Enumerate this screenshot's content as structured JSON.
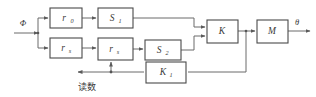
{
  "diagram": {
    "colors": {
      "background": "#ffffff",
      "box_stroke": "#4a4a4a",
      "wire": "#6b6b6b",
      "text": "#3a3a3a"
    },
    "blocks": [
      {
        "id": "r0",
        "label": "r",
        "subscript": "0",
        "x": 50,
        "y": 8,
        "w": 32,
        "h": 20
      },
      {
        "id": "s1",
        "label": "S",
        "subscript": "1",
        "x": 98,
        "y": 8,
        "w": 35,
        "h": 20
      },
      {
        "id": "rs",
        "label": "r",
        "subscript": "s",
        "x": 50,
        "y": 38,
        "w": 32,
        "h": 20
      },
      {
        "id": "rs2",
        "label": "r",
        "subscript": "s",
        "x": 98,
        "y": 38,
        "w": 35,
        "h": 22
      },
      {
        "id": "s2",
        "label": "S",
        "subscript": "2",
        "x": 145,
        "y": 40,
        "w": 36,
        "h": 20
      },
      {
        "id": "k",
        "label": "K",
        "subscript": "",
        "x": 207,
        "y": 20,
        "w": 31,
        "h": 23
      },
      {
        "id": "m",
        "label": "M",
        "subscript": "",
        "x": 257,
        "y": 20,
        "w": 31,
        "h": 23
      },
      {
        "id": "k1",
        "label": "K",
        "subscript": "1",
        "x": 146,
        "y": 62,
        "w": 40,
        "h": 21
      }
    ],
    "signals": {
      "input_label": "Φ",
      "output_label": "θ",
      "readout_label": "读数"
    }
  }
}
